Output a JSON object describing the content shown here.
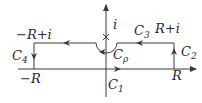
{
  "diagram": {
    "type": "complex-plane-contour",
    "colors": {
      "stroke": "#3a3a3a",
      "text": "#2a2a2a",
      "background": "#ffffff"
    },
    "labels": {
      "neg_R_plus_i": "−R+i",
      "C4": {
        "base": "C",
        "sub": "4"
      },
      "neg_R": "−R",
      "i": "i",
      "C3": {
        "base": "C",
        "sub": "3"
      },
      "R_plus_i": "R+i",
      "C2": {
        "base": "C",
        "sub": "2"
      },
      "C_rho": {
        "base": "C",
        "sub": "ρ"
      },
      "R": "R",
      "C1": {
        "base": "C",
        "sub": "1"
      }
    },
    "segments": [
      {
        "name": "C1",
        "from": "−R",
        "to": "R",
        "direction": "right"
      },
      {
        "name": "C2",
        "from": "R",
        "to": "R+i",
        "direction": "up"
      },
      {
        "name": "C3",
        "from": "R+i",
        "to": "−R+i",
        "direction": "left",
        "indent": "C_rho around i"
      },
      {
        "name": "C4",
        "from": "−R+i",
        "to": "−R",
        "direction": "down"
      }
    ],
    "pole_mark": "×"
  }
}
